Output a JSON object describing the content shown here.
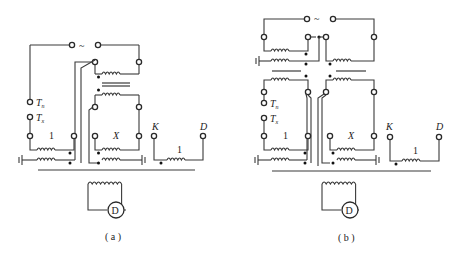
{
  "figures": [
    {
      "id": "a",
      "caption": "( a )",
      "source_symbol": "~",
      "terminals": {
        "tn": "T",
        "tn_sub": "n",
        "tx": "T",
        "tx_sub": "x",
        "k": "K",
        "d": "D"
      },
      "windings": {
        "standard": "1",
        "test": "X",
        "kd": "1"
      },
      "detector": "D"
    },
    {
      "id": "b",
      "caption": "( b )",
      "source_symbol": "~",
      "terminals": {
        "tn": "T",
        "tn_sub": "n",
        "tx": "T",
        "tx_sub": "x",
        "k": "K",
        "d": "D"
      },
      "windings": {
        "standard": "1",
        "test": "X",
        "kd": "1"
      },
      "detector": "D"
    }
  ]
}
